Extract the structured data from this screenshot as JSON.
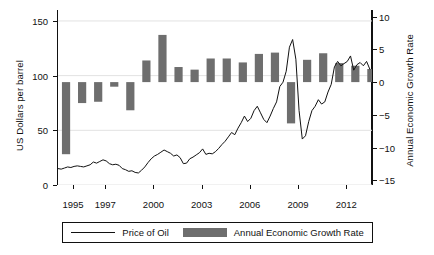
{
  "chart_data": {
    "type": "bar",
    "title": "",
    "xlabel": "",
    "ylabel": "US Dollars per barrel",
    "y2label": "Annual Economic Growth Rate",
    "grid": true,
    "legend_position": "bottom",
    "xlim": [
      1994.0,
      2013.6
    ],
    "ylim": [
      0,
      160
    ],
    "y2lim": [
      -15.7,
      11.0
    ],
    "yticks": [
      0,
      50,
      100,
      150
    ],
    "ytick_labels": [
      "0",
      "50",
      "100",
      "150"
    ],
    "y2ticks": [
      -15,
      -10,
      -5,
      0,
      5,
      10
    ],
    "y2tick_labels": [
      "−15",
      "−10",
      "−5",
      "0",
      "5",
      "10"
    ],
    "xticks": [
      1995,
      1997,
      2000,
      2003,
      2006,
      2009,
      2012
    ],
    "xtick_labels": [
      "1995",
      "1997",
      "2000",
      "2003",
      "2006",
      "2009",
      "2012"
    ],
    "series": [
      {
        "name": "Annual Economic Growth Rate",
        "type": "bar",
        "axis": "right",
        "color": "#6e6e6e",
        "categories": [
          1994,
          1995,
          1996,
          1997,
          1998,
          1999,
          2000,
          2001,
          2002,
          2003,
          2004,
          2005,
          2006,
          2007,
          2008,
          2009,
          2010,
          2011,
          2012,
          2013
        ],
        "values": [
          -11.0,
          -3.2,
          -3.0,
          -0.7,
          -4.3,
          3.3,
          7.2,
          2.3,
          1.9,
          3.6,
          3.6,
          3.0,
          4.3,
          4.5,
          -6.3,
          3.4,
          4.4,
          2.9,
          2.5,
          2.0
        ]
      },
      {
        "name": "Price of Oil",
        "type": "line",
        "axis": "left",
        "color": "#111111",
        "x": [
          1994.0,
          1994.2,
          1994.4,
          1994.6,
          1994.8,
          1995.0,
          1995.2,
          1995.4,
          1995.6,
          1995.8,
          1996.0,
          1996.2,
          1996.4,
          1996.6,
          1996.8,
          1997.0,
          1997.2,
          1997.4,
          1997.6,
          1997.8,
          1998.0,
          1998.2,
          1998.4,
          1998.6,
          1998.8,
          1999.0,
          1999.2,
          1999.4,
          1999.6,
          1999.8,
          2000.0,
          2000.2,
          2000.4,
          2000.6,
          2000.8,
          2001.0,
          2001.2,
          2001.4,
          2001.6,
          2001.8,
          2002.0,
          2002.2,
          2002.4,
          2002.6,
          2002.8,
          2003.0,
          2003.2,
          2003.4,
          2003.6,
          2003.8,
          2004.0,
          2004.2,
          2004.4,
          2004.6,
          2004.8,
          2005.0,
          2005.2,
          2005.4,
          2005.6,
          2005.8,
          2006.0,
          2006.2,
          2006.4,
          2006.6,
          2006.8,
          2007.0,
          2007.2,
          2007.4,
          2007.6,
          2007.8,
          2008.0,
          2008.2,
          2008.4,
          2008.6,
          2008.8,
          2009.0,
          2009.2,
          2009.4,
          2009.6,
          2009.8,
          2010.0,
          2010.2,
          2010.4,
          2010.6,
          2010.8,
          2011.0,
          2011.2,
          2011.4,
          2011.6,
          2011.8,
          2012.0,
          2012.2,
          2012.4,
          2012.6,
          2012.8,
          2013.0,
          2013.2,
          2013.4
        ],
        "y": [
          15.0,
          14.5,
          15.5,
          16.5,
          16.0,
          17.0,
          17.5,
          17.0,
          16.5,
          17.5,
          18.5,
          21.0,
          20.0,
          21.5,
          23.0,
          22.0,
          19.5,
          18.5,
          19.0,
          18.0,
          15.0,
          14.0,
          12.5,
          13.0,
          11.5,
          11.0,
          13.5,
          16.5,
          20.5,
          24.0,
          26.5,
          28.0,
          30.0,
          32.0,
          30.5,
          29.0,
          26.5,
          27.5,
          25.0,
          19.5,
          20.0,
          24.0,
          25.5,
          27.5,
          29.5,
          33.0,
          28.0,
          29.0,
          28.5,
          30.5,
          33.5,
          37.0,
          40.0,
          44.0,
          48.0,
          46.0,
          52.0,
          57.0,
          63.0,
          58.0,
          61.0,
          68.0,
          72.0,
          66.0,
          60.0,
          57.0,
          63.0,
          70.0,
          76.0,
          90.0,
          94.0,
          104.0,
          126.0,
          133.0,
          115.0,
          68.0,
          42.0,
          45.0,
          58.0,
          68.0,
          72.0,
          78.0,
          74.0,
          76.0,
          85.0,
          92.0,
          108.0,
          113.0,
          109.0,
          111.0,
          113.0,
          118.0,
          105.0,
          110.0,
          112.0,
          109.0,
          113.0,
          106.0
        ]
      }
    ]
  },
  "legend": {
    "items": [
      {
        "label": "Price of Oil",
        "marker": "line",
        "color": "#111111"
      },
      {
        "label": "Annual Economic Growth Rate",
        "marker": "swatch",
        "color": "#6e6e6e"
      }
    ]
  },
  "colors": {
    "bar": "#6e6e6e",
    "line": "#111111",
    "axis": "#111111",
    "grid": "#e2e2e2",
    "background": "#ffffff"
  }
}
